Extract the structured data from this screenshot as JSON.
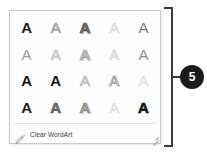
{
  "panel": {
    "name": "WordArt Styles Gallery",
    "background_color": "#fdfdfd",
    "border_color": "#c8c8c8"
  },
  "gallery": {
    "columns": 5,
    "rows": 4,
    "glyph": "A",
    "styles": [
      {
        "id": "style-1-1",
        "row": 1,
        "col": 1,
        "fill": "#1a1a1a",
        "outline": "none",
        "weight": "bold",
        "shadow": "none",
        "italic": false
      },
      {
        "id": "style-1-2",
        "row": 1,
        "col": 2,
        "fill": "#b0b0b0",
        "outline": "#9a9a9a",
        "weight": "normal",
        "shadow": "none",
        "italic": false
      },
      {
        "id": "style-1-3",
        "row": 1,
        "col": 3,
        "fill": "#6e6e6e",
        "outline": "#4a4a4a",
        "weight": "bold",
        "shadow": "1px 1px 1px rgba(0,0,0,0.35)",
        "italic": false
      },
      {
        "id": "style-1-4",
        "row": 1,
        "col": 4,
        "fill": "#ffffff",
        "outline": "#cfcfcf",
        "weight": "normal",
        "shadow": "none",
        "italic": false
      },
      {
        "id": "style-1-5",
        "row": 1,
        "col": 5,
        "fill": "#7a7a7a",
        "outline": "none",
        "weight": "normal",
        "shadow": "none",
        "italic": false
      },
      {
        "id": "style-2-1",
        "row": 2,
        "col": 1,
        "fill": "#9e9e9e",
        "outline": "none",
        "weight": "normal",
        "shadow": "none",
        "italic": false
      },
      {
        "id": "style-2-2",
        "row": 2,
        "col": 2,
        "fill": "#d2d2d2",
        "outline": "#c0c0c0",
        "weight": "normal",
        "shadow": "none",
        "italic": false
      },
      {
        "id": "style-2-3",
        "row": 2,
        "col": 3,
        "fill": "#b8b8b8",
        "outline": "#a2a2a2",
        "weight": "bold",
        "shadow": "1px 1px 1px rgba(0,0,0,0.18)",
        "italic": false
      },
      {
        "id": "style-2-4",
        "row": 2,
        "col": 4,
        "fill": "#ffffff",
        "outline": "#c4c4c4",
        "weight": "normal",
        "shadow": "none",
        "italic": false
      },
      {
        "id": "style-2-5",
        "row": 2,
        "col": 5,
        "fill": "#8d8d8d",
        "outline": "none",
        "weight": "normal",
        "shadow": "none",
        "italic": false
      },
      {
        "id": "style-3-1",
        "row": 3,
        "col": 1,
        "fill": "#141414",
        "outline": "none",
        "weight": "bold",
        "shadow": "none",
        "italic": false
      },
      {
        "id": "style-3-2",
        "row": 3,
        "col": 2,
        "fill": "#161616",
        "outline": "none",
        "weight": "bold",
        "shadow": "none",
        "italic": false
      },
      {
        "id": "style-3-3",
        "row": 3,
        "col": 3,
        "fill": "#c6c6c6",
        "outline": "#b4b4b4",
        "weight": "normal",
        "shadow": "none",
        "italic": false
      },
      {
        "id": "style-3-4",
        "row": 3,
        "col": 4,
        "fill": "#ffffff",
        "outline": "#6a6a6a",
        "weight": "normal",
        "shadow": "none",
        "italic": false
      },
      {
        "id": "style-3-5",
        "row": 3,
        "col": 5,
        "fill": "#ffffff",
        "outline": "#d6d6d6",
        "weight": "normal",
        "shadow": "none",
        "italic": false
      },
      {
        "id": "style-4-1",
        "row": 4,
        "col": 1,
        "fill": "#1f1f1f",
        "outline": "none",
        "weight": "bold",
        "shadow": "none",
        "italic": false
      },
      {
        "id": "style-4-2",
        "row": 4,
        "col": 2,
        "fill": "#6d6d6d",
        "outline": "#555555",
        "weight": "bold",
        "shadow": "none",
        "italic": false
      },
      {
        "id": "style-4-3",
        "row": 4,
        "col": 3,
        "fill": "#9b9b9b",
        "outline": "#858585",
        "weight": "bold",
        "shadow": "1px 1px 1px rgba(0,0,0,0.20)",
        "italic": false
      },
      {
        "id": "style-4-4",
        "row": 4,
        "col": 4,
        "fill": "#ededed",
        "outline": "#dcdcdc",
        "weight": "normal",
        "shadow": "none",
        "italic": false
      },
      {
        "id": "style-4-5",
        "row": 4,
        "col": 5,
        "fill": "#1d1d1d",
        "outline": "#000000",
        "weight": "bold",
        "shadow": "none",
        "italic": false
      }
    ]
  },
  "clear_command": {
    "label": "Clear WordArt",
    "icon": "clear-wordart-icon"
  },
  "resize_grip": {
    "label": "Resize"
  },
  "annotation": {
    "number": "5",
    "badge_color": "#1b1b1b",
    "bracket_color": "#3a3a3a"
  }
}
